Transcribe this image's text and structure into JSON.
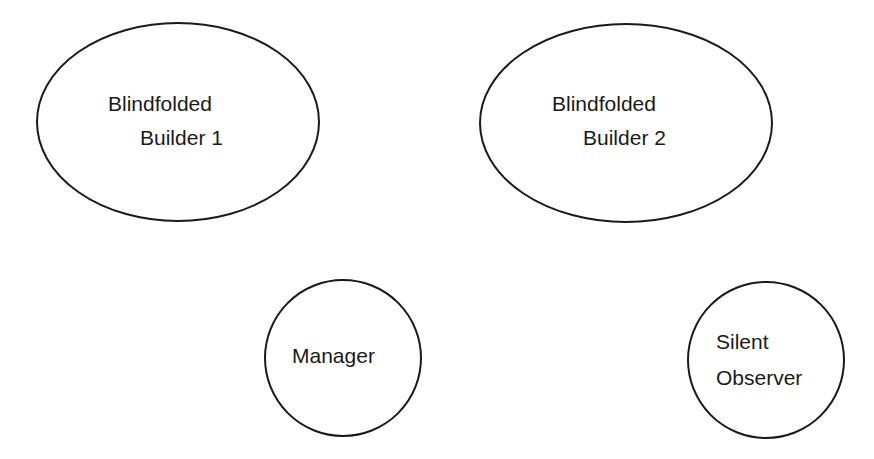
{
  "diagram": {
    "nodes": [
      {
        "id": "builder1",
        "shape": "ellipse",
        "lines": [
          "Blindfolded",
          "Builder 1"
        ]
      },
      {
        "id": "builder2",
        "shape": "ellipse",
        "lines": [
          "Blindfolded",
          "Builder 2"
        ]
      },
      {
        "id": "manager",
        "shape": "circle",
        "lines": [
          "Manager"
        ]
      },
      {
        "id": "observer",
        "shape": "circle",
        "lines": [
          "Silent",
          "Observer"
        ]
      }
    ],
    "stroke_color": "#1a1a1a",
    "background_color": "#ffffff"
  }
}
